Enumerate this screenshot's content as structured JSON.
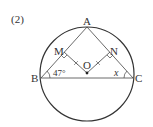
{
  "problem_number": "(2)",
  "points": {
    "A": "A",
    "B": "B",
    "C": "C",
    "M": "M",
    "N": "N",
    "O": "O"
  },
  "angles": {
    "B": "47°",
    "C": "x"
  },
  "colors": {
    "stroke": "#333333",
    "circle": "#333333",
    "background": "#ffffff"
  }
}
